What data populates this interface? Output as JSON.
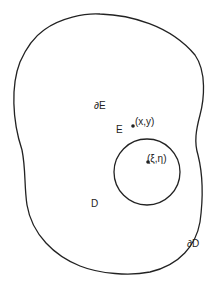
{
  "diagram": {
    "header_text": "",
    "outer_region": {
      "label": "D",
      "boundary_label": "∂D"
    },
    "inner_region": {
      "label": "E",
      "boundary_label": "∂E"
    },
    "points": [
      {
        "name": "point-xy",
        "label": "(x,y)"
      },
      {
        "name": "point-xi-eta",
        "label": "(ξ,η)"
      }
    ],
    "stroke_color": "#222222"
  }
}
